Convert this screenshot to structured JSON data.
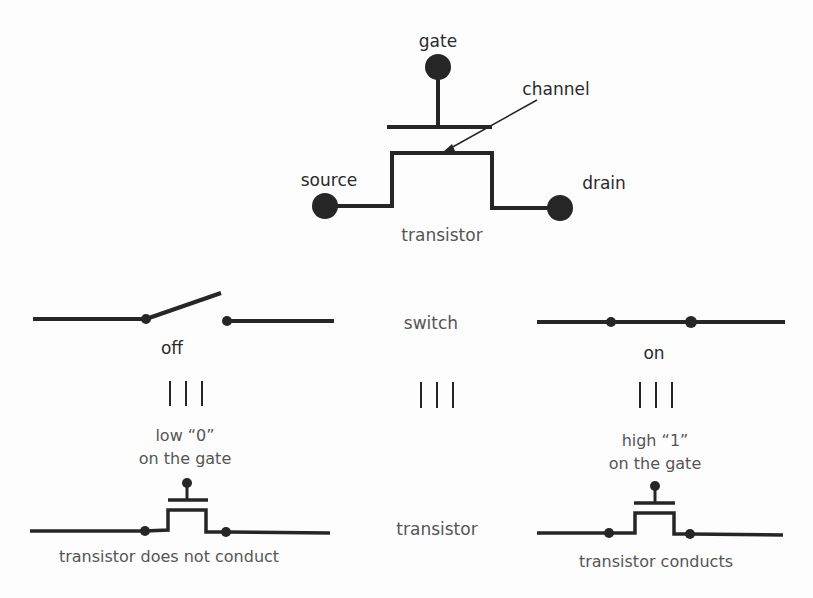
{
  "colors": {
    "ink": "#262626",
    "label_dark": "#2a2a2a",
    "label_gray": "#555555",
    "background": "#fdfdfd"
  },
  "top_transistor": {
    "gate_label": "gate",
    "channel_label": "channel",
    "source_label": "source",
    "drain_label": "drain",
    "caption": "transistor"
  },
  "switch_row": {
    "off_label": "off",
    "center_label": "switch",
    "on_label": "on",
    "equivalence_symbol": "|||"
  },
  "bottom_row": {
    "left_gate_line1": "low “0”",
    "left_gate_line2": "on the gate",
    "left_caption": "transistor does not conduct",
    "center_label": "transistor",
    "right_gate_line1": "high “1”",
    "right_gate_line2": "on the gate",
    "right_caption": "transistor conducts"
  }
}
